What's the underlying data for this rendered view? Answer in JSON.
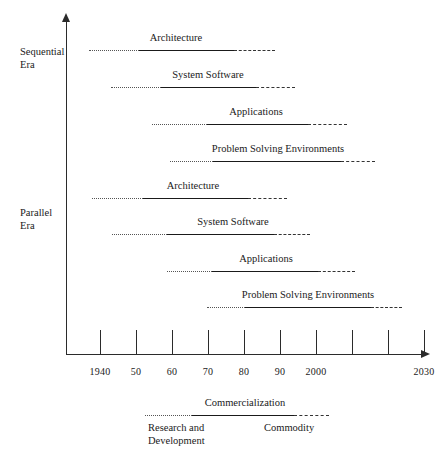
{
  "chart_data": {
    "type": "table",
    "title": "",
    "xlabel": "",
    "ylabel": "",
    "xlim": [
      1940,
      2033
    ],
    "grid": false,
    "legend_position": "bottom",
    "axis": {
      "ticks": [
        {
          "label": "1940",
          "x": 100
        },
        {
          "label": "50",
          "x": 136
        },
        {
          "label": "60",
          "x": 172
        },
        {
          "label": "70",
          "x": 208
        },
        {
          "label": "80",
          "x": 244
        },
        {
          "label": "90",
          "x": 280
        },
        {
          "label": "2000",
          "x": 316
        },
        {
          "label": "",
          "x": 352
        },
        {
          "label": "",
          "x": 388
        },
        {
          "label": "2030",
          "x": 424
        }
      ]
    },
    "eras": [
      {
        "name": "Sequential\nEra",
        "line1": "Sequential",
        "line2": "Era",
        "top": 45
      },
      {
        "name": "Parallel\nEra",
        "line1": "Parallel",
        "line2": "Era",
        "top": 206
      }
    ],
    "bars": [
      {
        "label": "Architecture",
        "era": "Sequential Era",
        "top": 32,
        "label_center": 176,
        "dotted": {
          "start": 89,
          "end": 139
        },
        "solid": {
          "start": 139,
          "end": 234
        },
        "dashed": {
          "start": 234,
          "end": 275
        }
      },
      {
        "label": "System Software",
        "era": "Sequential Era",
        "top": 69,
        "label_center": 208,
        "dotted": {
          "start": 111,
          "end": 161
        },
        "solid": {
          "start": 161,
          "end": 256
        },
        "dashed": {
          "start": 256,
          "end": 295
        }
      },
      {
        "label": "Applications",
        "era": "Sequential Era",
        "top": 106,
        "label_center": 256,
        "dotted": {
          "start": 152,
          "end": 207
        },
        "solid": {
          "start": 207,
          "end": 308
        },
        "dashed": {
          "start": 308,
          "end": 347
        }
      },
      {
        "label": "Problem Solving Environments",
        "era": "Sequential Era",
        "top": 143,
        "label_center": 278,
        "dotted": {
          "start": 170,
          "end": 213
        },
        "solid": {
          "start": 213,
          "end": 341
        },
        "dashed": {
          "start": 341,
          "end": 375
        }
      },
      {
        "label": "Architecture",
        "era": "Parallel Era",
        "top": 180,
        "label_center": 193,
        "dotted": {
          "start": 92,
          "end": 143
        },
        "solid": {
          "start": 143,
          "end": 248
        },
        "dashed": {
          "start": 248,
          "end": 287
        }
      },
      {
        "label": "System Software",
        "era": "Parallel Era",
        "top": 216,
        "label_center": 233,
        "dotted": {
          "start": 112,
          "end": 167
        },
        "solid": {
          "start": 167,
          "end": 274
        },
        "dashed": {
          "start": 274,
          "end": 310
        }
      },
      {
        "label": "Applications",
        "era": "Parallel Era",
        "top": 253,
        "label_center": 266,
        "dotted": {
          "start": 167,
          "end": 212
        },
        "solid": {
          "start": 212,
          "end": 318
        },
        "dashed": {
          "start": 318,
          "end": 355
        }
      },
      {
        "label": "Problem Solving Environments",
        "era": "Parallel Era",
        "top": 289,
        "label_center": 308,
        "dotted": {
          "start": 207,
          "end": 245
        },
        "solid": {
          "start": 245,
          "end": 371
        },
        "dashed": {
          "start": 371,
          "end": 402
        }
      }
    ],
    "legend": {
      "top": 397,
      "bar": {
        "dotted": {
          "start": 145,
          "end": 192
        },
        "solid": {
          "start": 192,
          "end": 294
        },
        "dashed": {
          "start": 294,
          "end": 329
        }
      },
      "title": "Commercialization",
      "title_center": 245,
      "phases": [
        {
          "key": "dotted",
          "line1": "Research and",
          "line2": "Development",
          "left": 148
        },
        {
          "key": "solid",
          "line1": "",
          "line2": "",
          "left": 0
        },
        {
          "key": "dashed",
          "line1": "Commodity",
          "line2": "",
          "left": 264
        }
      ]
    }
  }
}
